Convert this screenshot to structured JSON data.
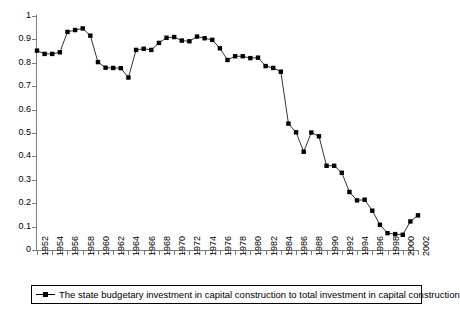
{
  "chart_data": {
    "type": "line",
    "title": "",
    "subtitle": "",
    "xlabel": "",
    "ylabel": "",
    "xlim": [
      1952,
      2002
    ],
    "ylim": [
      0,
      1
    ],
    "grid": false,
    "legend_position": "bottom",
    "marker": "square",
    "line_color": "#000000",
    "marker_color": "#000000",
    "axis_color": "#7a7a7a",
    "y_ticks": [
      "0",
      "0.1",
      "0.2",
      "0.3",
      "0.4",
      "0.5",
      "0.6",
      "0.7",
      "0.8",
      "0.9",
      "1"
    ],
    "y_tick_values": [
      0,
      0.1,
      0.2,
      0.3,
      0.4,
      0.5,
      0.6,
      0.7,
      0.8,
      0.9,
      1
    ],
    "x_tick_labels": [
      "1952",
      "1954",
      "1956",
      "1958",
      "1960",
      "1962",
      "1964",
      "1966",
      "1968",
      "1970",
      "1972",
      "1974",
      "1976",
      "1978",
      "1980",
      "1982",
      "1984",
      "1986",
      "1988",
      "1990",
      "1992",
      "1994",
      "1996",
      "1998",
      "2000",
      "2002"
    ],
    "legend": [
      {
        "label": "The state budgetary investment in capital construction to total investment in capital construction",
        "marker": "line-square",
        "color": "#000000"
      }
    ],
    "series": [
      {
        "name": "The state budgetary investment in capital construction to total investment in capital construction",
        "x": [
          1952,
          1953,
          1954,
          1955,
          1956,
          1957,
          1958,
          1959,
          1960,
          1961,
          1962,
          1963,
          1964,
          1965,
          1966,
          1967,
          1968,
          1969,
          1970,
          1971,
          1972,
          1973,
          1974,
          1975,
          1976,
          1977,
          1978,
          1979,
          1980,
          1981,
          1982,
          1983,
          1984,
          1985,
          1986,
          1987,
          1988,
          1989,
          1990,
          1991,
          1992,
          1993,
          1994,
          1995,
          1996,
          1997,
          1998,
          1999,
          2000,
          2001,
          2002
        ],
        "values": [
          0.852,
          0.838,
          0.838,
          0.845,
          0.932,
          0.94,
          0.947,
          0.916,
          0.803,
          0.779,
          0.778,
          0.777,
          0.737,
          0.855,
          0.86,
          0.855,
          0.885,
          0.907,
          0.91,
          0.895,
          0.892,
          0.912,
          0.905,
          0.898,
          0.862,
          0.812,
          0.828,
          0.828,
          0.82,
          0.822,
          0.786,
          0.778,
          0.762,
          0.54,
          0.503,
          0.42,
          0.502,
          0.486,
          0.36,
          0.36,
          0.33,
          0.248,
          0.212,
          0.215,
          0.168,
          0.108,
          0.072,
          0.068,
          0.065,
          0.122,
          0.148
        ]
      }
    ]
  }
}
